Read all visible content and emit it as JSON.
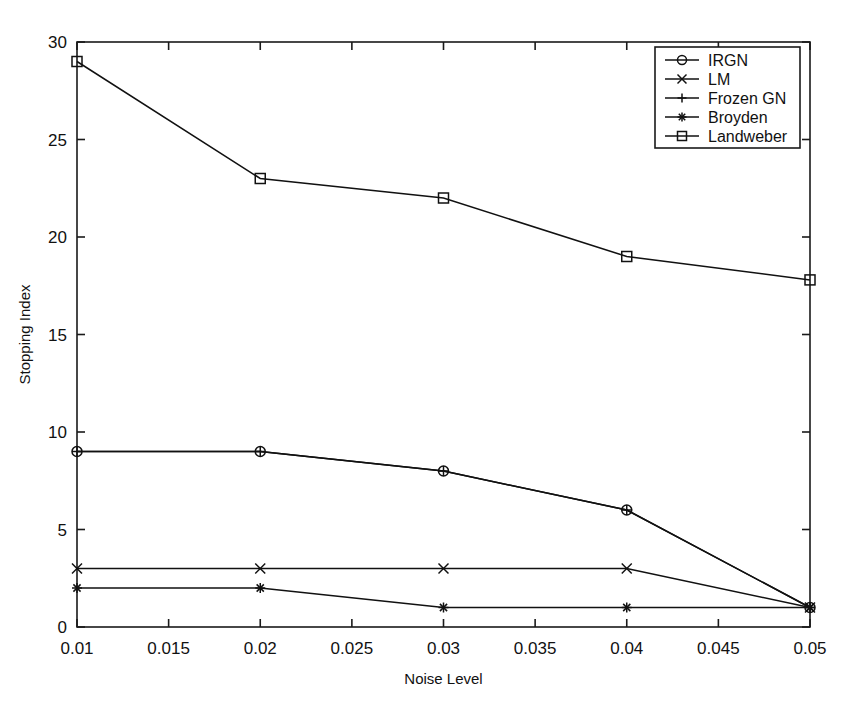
{
  "chart_data": {
    "type": "line",
    "title": "",
    "xlabel": "Noise Level",
    "ylabel": "Stopping Index",
    "x": [
      0.01,
      0.02,
      0.03,
      0.04,
      0.05
    ],
    "xlim": [
      0.01,
      0.05
    ],
    "ylim": [
      0,
      30
    ],
    "xticks": [
      0.01,
      0.015,
      0.02,
      0.025,
      0.03,
      0.035,
      0.04,
      0.045,
      0.05
    ],
    "xtick_labels": [
      "0.01",
      "0.015",
      "0.02",
      "0.025",
      "0.03",
      "0.035",
      "0.04",
      "0.045",
      "0.05"
    ],
    "yticks": [
      0,
      5,
      10,
      15,
      20,
      25,
      30
    ],
    "ytick_labels": [
      "0",
      "5",
      "10",
      "15",
      "20",
      "25",
      "30"
    ],
    "grid": false,
    "legend_position": "upper right",
    "series": [
      {
        "name": "IRGN",
        "marker": "circle",
        "values": [
          9,
          9,
          8,
          6,
          1
        ]
      },
      {
        "name": "LM",
        "marker": "x",
        "values": [
          3,
          3,
          3,
          3,
          1
        ]
      },
      {
        "name": "Frozen GN",
        "marker": "plus",
        "values": [
          9,
          9,
          8,
          6,
          1
        ]
      },
      {
        "name": "Broyden",
        "marker": "asterisk",
        "values": [
          2,
          2,
          1,
          1,
          1
        ]
      },
      {
        "name": "Landweber",
        "marker": "square",
        "values": [
          29,
          23,
          22,
          19,
          17.8
        ]
      }
    ]
  },
  "legend": {
    "entries": [
      {
        "label": "IRGN"
      },
      {
        "label": "LM"
      },
      {
        "label": "Frozen GN"
      },
      {
        "label": "Broyden"
      },
      {
        "label": "Landweber"
      }
    ]
  },
  "colors": {
    "line": "#111111",
    "frame": "#1a1a1a",
    "background": "#ffffff"
  }
}
